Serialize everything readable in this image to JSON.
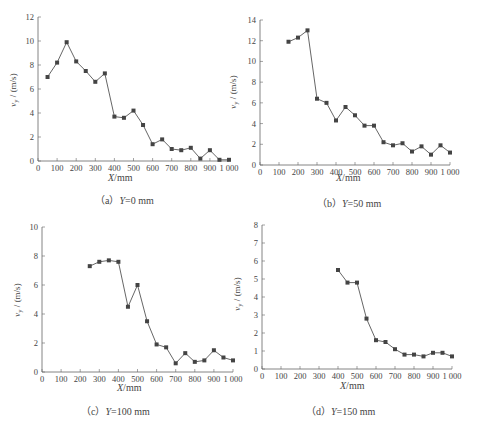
{
  "chart_data": [
    {
      "type": "line",
      "id": "a",
      "caption_prefix": "（a）",
      "caption_var": "Y",
      "caption_rest": "=0 mm",
      "xlabel_var": "X",
      "xlabel_unit": "/mm",
      "ylabel": "v_y / (m/s)",
      "xlim": [
        0,
        1000
      ],
      "ylim": [
        0,
        12
      ],
      "xticks": [
        0,
        100,
        200,
        300,
        400,
        500,
        600,
        700,
        800,
        900,
        1000
      ],
      "xtick_labels": [
        "0",
        "100",
        "200",
        "300",
        "400",
        "500",
        "600",
        "700",
        "800",
        "900",
        "1 000"
      ],
      "yticks": [
        0,
        2,
        4,
        6,
        8,
        10,
        12
      ],
      "x": [
        50,
        100,
        150,
        200,
        250,
        300,
        350,
        400,
        450,
        500,
        550,
        600,
        650,
        700,
        750,
        800,
        850,
        900,
        950,
        1000
      ],
      "values": [
        7.0,
        8.2,
        9.9,
        8.3,
        7.5,
        6.6,
        7.3,
        3.7,
        3.6,
        4.2,
        3.0,
        1.4,
        1.8,
        1.0,
        0.9,
        1.1,
        0.2,
        0.9,
        0.1,
        0.1
      ],
      "marker": "square",
      "grid": false
    },
    {
      "type": "line",
      "id": "b",
      "caption_prefix": "（b）",
      "caption_var": "Y",
      "caption_rest": "=50 mm",
      "xlabel_var": "X",
      "xlabel_unit": "/mm",
      "ylabel": "v_y / (m/s)",
      "xlim": [
        0,
        1000
      ],
      "ylim": [
        0,
        14
      ],
      "xticks": [
        0,
        100,
        200,
        300,
        400,
        500,
        600,
        700,
        800,
        900,
        1000
      ],
      "xtick_labels": [
        "0",
        "100",
        "200",
        "300",
        "400",
        "500",
        "600",
        "700",
        "800",
        "900",
        "1 000"
      ],
      "yticks": [
        0,
        2,
        4,
        6,
        8,
        10,
        12,
        14
      ],
      "x": [
        150,
        200,
        250,
        300,
        350,
        400,
        450,
        500,
        550,
        600,
        650,
        700,
        750,
        800,
        850,
        900,
        950,
        1000
      ],
      "values": [
        11.9,
        12.3,
        13.0,
        6.4,
        6.0,
        4.3,
        5.6,
        4.8,
        3.8,
        3.8,
        2.2,
        1.9,
        2.1,
        1.3,
        1.8,
        1.0,
        1.9,
        1.2
      ],
      "marker": "square",
      "grid": false
    },
    {
      "type": "line",
      "id": "c",
      "caption_prefix": "（c）",
      "caption_var": "Y",
      "caption_rest": "=100 mm",
      "xlabel_var": "X",
      "xlabel_unit": "/mm",
      "ylabel": "v_y / (m/s)",
      "xlim": [
        0,
        1000
      ],
      "ylim": [
        0,
        10
      ],
      "xticks": [
        0,
        100,
        200,
        300,
        400,
        500,
        600,
        700,
        800,
        900,
        1000
      ],
      "xtick_labels": [
        "0",
        "100",
        "200",
        "300",
        "400",
        "500",
        "600",
        "700",
        "800",
        "900",
        "1 000"
      ],
      "yticks": [
        0,
        2,
        4,
        6,
        8,
        10
      ],
      "x": [
        250,
        300,
        350,
        400,
        450,
        500,
        550,
        600,
        650,
        700,
        750,
        800,
        850,
        900,
        950,
        1000
      ],
      "values": [
        7.3,
        7.6,
        7.7,
        7.6,
        4.5,
        6.0,
        3.5,
        1.9,
        1.7,
        0.6,
        1.3,
        0.7,
        0.8,
        1.5,
        1.0,
        0.8
      ],
      "marker": "square",
      "grid": false
    },
    {
      "type": "line",
      "id": "d",
      "caption_prefix": "（d）",
      "caption_var": "Y",
      "caption_rest": "=150 mm",
      "xlabel_var": "X",
      "xlabel_unit": "/mm",
      "ylabel": "v_y / (m/s)",
      "xlim": [
        0,
        1000
      ],
      "ylim": [
        0,
        8
      ],
      "xticks": [
        0,
        100,
        200,
        300,
        400,
        500,
        600,
        700,
        800,
        900,
        1000
      ],
      "xtick_labels": [
        "0",
        "100",
        "200",
        "300",
        "400",
        "500",
        "600",
        "700",
        "800",
        "900",
        "1 000"
      ],
      "yticks": [
        0,
        1,
        2,
        3,
        4,
        5,
        6,
        7,
        8
      ],
      "x": [
        400,
        450,
        500,
        550,
        600,
        650,
        700,
        750,
        800,
        850,
        900,
        950,
        1000
      ],
      "values": [
        5.5,
        4.8,
        4.8,
        2.8,
        1.6,
        1.5,
        1.1,
        0.8,
        0.8,
        0.7,
        0.9,
        0.9,
        0.7
      ],
      "marker": "square",
      "grid": false
    }
  ],
  "layout": [
    {
      "ox": 38,
      "oy": 161,
      "xw": 191,
      "yh": 144,
      "cap_x": 130,
      "cap_y": 198,
      "xl_x": 124,
      "xl_y": 178,
      "yl_x": 16,
      "yl_y": 90
    },
    {
      "ox": 260,
      "oy": 165,
      "xw": 190,
      "yh": 145,
      "cap_x": 352,
      "cap_y": 201,
      "xl_x": 352,
      "xl_y": 178,
      "yl_x": 236,
      "yl_y": 92
    },
    {
      "ox": 42,
      "oy": 372,
      "xw": 191,
      "yh": 145,
      "cap_x": 116,
      "cap_y": 409,
      "xl_x": 133,
      "xl_y": 388,
      "yl_x": 20,
      "yl_y": 300
    },
    {
      "ox": 262,
      "oy": 369,
      "xw": 190,
      "yh": 144,
      "cap_x": 341,
      "cap_y": 409,
      "xl_x": 356,
      "xl_y": 386,
      "yl_x": 240,
      "yl_y": 294
    }
  ],
  "style": {
    "line_color": "#555555",
    "marker_color": "#444444",
    "axis_color": "#666666"
  }
}
